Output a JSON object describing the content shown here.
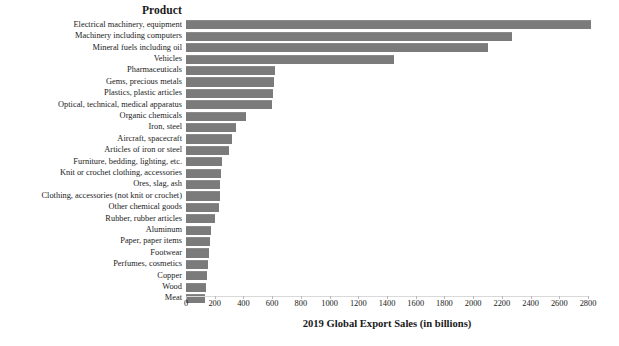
{
  "chart_data": {
    "type": "bar",
    "orientation": "horizontal",
    "title": "",
    "category_axis_title": "Product",
    "xlabel": "2019 Global Export Sales (in billions)",
    "ylabel": "Product",
    "xlim": [
      0,
      2800
    ],
    "xtick_step": 200,
    "xticks": [
      0,
      200,
      400,
      600,
      800,
      1000,
      1200,
      1400,
      1600,
      1800,
      2000,
      2200,
      2400,
      2600,
      2800
    ],
    "grid": false,
    "legend": false,
    "bar_color": "#7b7b7b",
    "sorted": "descending",
    "categories": [
      "Electrical machinery, equipment",
      "Machinery including computers",
      "Mineral fuels including oil",
      "Vehicles",
      "Pharmaceuticals",
      "Gems, precious metals",
      "Plastics, plastic articles",
      "Optical, technical, medical apparatus",
      "Organic chemicals",
      "Iron, steel",
      "Aircraft, spacecraft",
      "Articles of iron or steel",
      "Furniture, bedding, lighting, etc.",
      "Knit or crochet clothing, accessories",
      "Ores, slag, ash",
      "Clothing, accessories (not knit or crochet)",
      "Other chemical goods",
      "Rubber, rubber articles",
      "Aluminum",
      "Paper, paper items",
      "Footwear",
      "Perfumes, cosmetics",
      "Copper",
      "Wood",
      "Meat"
    ],
    "values": [
      2820,
      2270,
      2100,
      1450,
      620,
      610,
      605,
      600,
      420,
      350,
      320,
      300,
      250,
      245,
      240,
      235,
      230,
      200,
      175,
      170,
      160,
      150,
      145,
      140,
      135
    ]
  },
  "axis": {
    "x_title": "2019 Global Export Sales (in billions)"
  },
  "header": {
    "product_label": "Product"
  }
}
